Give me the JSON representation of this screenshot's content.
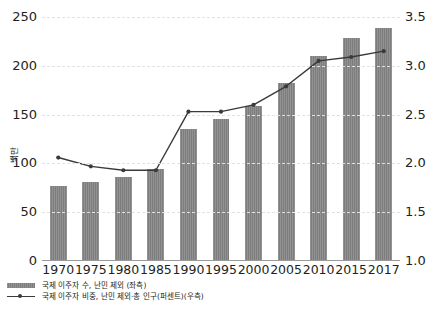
{
  "chart_data": {
    "type": "bar",
    "title": "",
    "subtitle": "",
    "xlabel": "",
    "ylabel": "백만",
    "ylabel_right": "총 인구 대비 퍼센트",
    "grid": true,
    "legend_position": "bottom-left",
    "categories": [
      "1970",
      "1975",
      "1980",
      "1985",
      "1990",
      "1995",
      "2000",
      "2005",
      "2010",
      "2015",
      "2017"
    ],
    "ylim": [
      0,
      250
    ],
    "yticks": [
      "0",
      "50",
      "100",
      "150",
      "200",
      "250"
    ],
    "ylim_right": [
      1.0,
      3.5
    ],
    "yticks_right": [
      "1.0",
      "1.5",
      "2.0",
      "2.5",
      "3.0",
      "3.5"
    ],
    "series": [
      {
        "name": "국제 이주자 수, 난민 제외 (좌측)",
        "type": "bar",
        "axis": "left",
        "color": "#7d7d7d",
        "values": [
          77,
          81,
          86,
          94,
          135,
          145,
          159,
          182,
          210,
          228,
          239
        ]
      },
      {
        "name": "국제 이주자 비중, 난민 제외·총 인구(퍼센트)(우측)",
        "type": "line",
        "axis": "right",
        "color": "#3a3a3a",
        "values": [
          2.06,
          1.97,
          1.93,
          1.93,
          2.53,
          2.53,
          2.6,
          2.79,
          3.05,
          3.09,
          3.15
        ]
      }
    ]
  },
  "legend": {
    "items": [
      {
        "label": "국제 이주자 수, 난민 제외 (좌측)",
        "key": "bar-swatch"
      },
      {
        "label": "국제 이주자 비중, 난민 제외·총 인구(퍼센트)(우측)",
        "key": "line-swatch"
      }
    ]
  },
  "source_note": ""
}
